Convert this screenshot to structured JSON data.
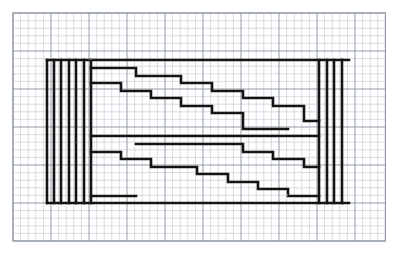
{
  "document": {
    "title": "Stepped Meander Pattern on Graph Paper",
    "medium": "graph-paper-technical-drawing",
    "description": "Symmetric interlocking staircase (meander / labyrinth) motif drawn in heavy black ink over a light blue-grey square grid, bounded by a rectangular frame with vertical bar groups at left and right."
  },
  "canvas": {
    "width": 396,
    "height": 253,
    "background_color": "#ffffff"
  },
  "grid": {
    "visible": true,
    "cell_size": 7.6,
    "origin_x": 13,
    "origin_y": 13,
    "cols": 49,
    "rows": 30,
    "minor_color": "#b9c0cb",
    "minor_width": 0.55,
    "major_color": "#8d97a5",
    "major_width": 0.95,
    "major_every": 5,
    "border_color": "#8d97a5",
    "border_width": 1.1
  },
  "ink": {
    "color": "#141414",
    "stroke_width": 2.6,
    "thin_stroke_width": 2.2
  },
  "figure": {
    "frame": {
      "left_x": 47,
      "right_x": 349,
      "top_y": 60,
      "bottom_y": 203,
      "label": "outer-rectangle-frame"
    },
    "left_bars": {
      "label": "left-vertical-bar-group",
      "count": 7,
      "x_positions": [
        47,
        54,
        61,
        69,
        76,
        84,
        91
      ],
      "top_y": 60,
      "bottom_y": 203
    },
    "right_bars": {
      "label": "right-vertical-bar-group",
      "count": 4,
      "x_positions": [
        319,
        327,
        334,
        342
      ],
      "top_y": 60,
      "bottom_y": 203
    },
    "upper_staircase_outer": {
      "label": "upper-outer-descending-step-line",
      "points": [
        [
          91,
          68
        ],
        [
          136,
          68
        ],
        [
          136,
          76
        ],
        [
          181,
          76
        ],
        [
          181,
          83
        ],
        [
          212,
          83
        ],
        [
          212,
          91
        ],
        [
          243,
          91
        ],
        [
          243,
          98
        ],
        [
          273,
          98
        ],
        [
          273,
          106
        ],
        [
          304,
          106
        ],
        [
          304,
          121
        ],
        [
          319,
          121
        ]
      ]
    },
    "upper_staircase_inner": {
      "label": "upper-inner-descending-step-line",
      "points": [
        [
          91,
          83
        ],
        [
          121,
          83
        ],
        [
          121,
          91
        ],
        [
          151,
          91
        ],
        [
          151,
          98
        ],
        [
          181,
          98
        ],
        [
          181,
          106
        ],
        [
          212,
          106
        ],
        [
          212,
          113
        ],
        [
          243,
          113
        ],
        [
          243,
          129
        ],
        [
          288,
          129
        ]
      ]
    },
    "mid_line": {
      "label": "central-horizontal-line",
      "points": [
        [
          91,
          136
        ],
        [
          319,
          136
        ]
      ]
    },
    "lower_staircase_inner": {
      "label": "lower-inner-descending-step-line",
      "points": [
        [
          136,
          144
        ],
        [
          243,
          144
        ],
        [
          243,
          152
        ],
        [
          273,
          152
        ],
        [
          273,
          159
        ],
        [
          304,
          159
        ],
        [
          304,
          167
        ],
        [
          319,
          167
        ]
      ]
    },
    "lower_staircase_outer": {
      "label": "lower-outer-descending-step-line",
      "points": [
        [
          91,
          152
        ],
        [
          121,
          152
        ],
        [
          121,
          159
        ],
        [
          151,
          159
        ],
        [
          151,
          167
        ],
        [
          197,
          167
        ],
        [
          197,
          174
        ],
        [
          228,
          174
        ],
        [
          228,
          182
        ],
        [
          258,
          182
        ],
        [
          258,
          189
        ],
        [
          288,
          189
        ],
        [
          288,
          196
        ],
        [
          319,
          196
        ]
      ]
    },
    "lower_tail": {
      "label": "lower-left-tail-line",
      "points": [
        [
          91,
          196
        ],
        [
          136,
          196
        ]
      ]
    }
  },
  "legend": {
    "visible": false,
    "entries": []
  },
  "annotations": {
    "visible": false,
    "texts": []
  }
}
